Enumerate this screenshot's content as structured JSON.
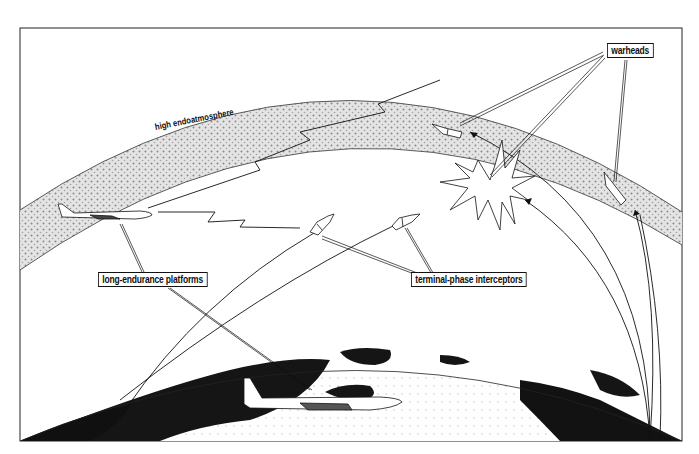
{
  "diagram": {
    "labels": {
      "warheads": "warheads",
      "atmosphere": "high endoatmosphere",
      "platforms": "long-endurance platforms",
      "interceptors": "terminal-phase interceptors"
    },
    "elements": [
      {
        "name": "earth",
        "description": "curved Earth surface with dark landmasses"
      },
      {
        "name": "high-endoatmosphere-band",
        "description": "stippled gray atmospheric band"
      },
      {
        "name": "aircraft-upper-left",
        "description": "long-endurance platform aircraft at altitude"
      },
      {
        "name": "aircraft-lower",
        "description": "long-endurance platform aircraft near surface"
      },
      {
        "name": "interceptor-1",
        "description": "terminal-phase interceptor missile"
      },
      {
        "name": "interceptor-2",
        "description": "terminal-phase interceptor missile"
      },
      {
        "name": "warhead-1",
        "description": "warhead in high endoatmosphere"
      },
      {
        "name": "warhead-2",
        "description": "warhead descending on right"
      },
      {
        "name": "explosion",
        "description": "intercept burst"
      },
      {
        "name": "laser-links",
        "description": "zigzag communication links from upper aircraft"
      }
    ],
    "colors": {
      "ink": "#111111",
      "paper": "#ffffff",
      "atmosphere": "#bdbdbd",
      "land": "#111111"
    }
  }
}
